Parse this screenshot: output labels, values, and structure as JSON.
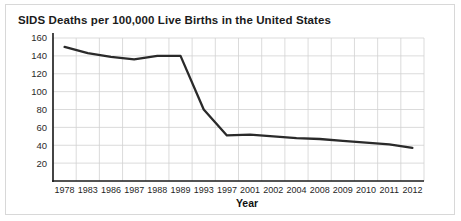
{
  "chart_data": {
    "type": "line",
    "title": "SIDS Deaths per 100,000 Live Births in the United States",
    "xlabel": "Year",
    "ylabel": "",
    "categories": [
      "1978",
      "1983",
      "1986",
      "1987",
      "1988",
      "1989",
      "1993",
      "1997",
      "2001",
      "2002",
      "2004",
      "2008",
      "2009",
      "2010",
      "2011",
      "2012"
    ],
    "values": [
      150,
      143,
      139,
      136,
      140,
      140,
      80,
      51,
      52,
      50,
      48,
      47,
      45,
      43,
      41,
      37
    ],
    "ylim": [
      0,
      160
    ],
    "yticks": [
      20,
      40,
      60,
      80,
      100,
      120,
      140,
      160
    ],
    "grid": true,
    "legend": false
  },
  "axis": {
    "y_labels": [
      "160",
      "140",
      "120",
      "100",
      "80",
      "60",
      "40",
      "20"
    ],
    "x_labels": [
      "1978",
      "1983",
      "1986",
      "1987",
      "1988",
      "1989",
      "1993",
      "1997",
      "2001",
      "2002",
      "2004",
      "2008",
      "2009",
      "2010",
      "2011",
      "2012"
    ],
    "x_title": "Year"
  },
  "colors": {
    "line": "#2a2a2a",
    "grid": "#d2d2d2",
    "axis": "#1a1a1a",
    "background": "#ffffff",
    "border": "#d8d8d8"
  }
}
